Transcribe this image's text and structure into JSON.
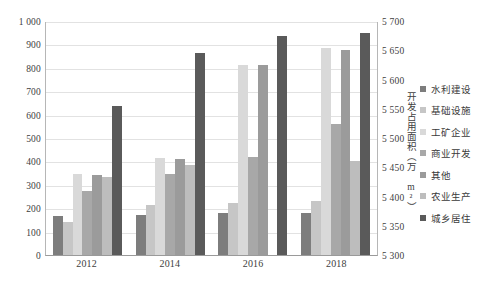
{
  "chart_data": {
    "type": "bar",
    "title": "",
    "subtitle": "",
    "xlabel": "",
    "ylabel": "",
    "categories": [
      "2012",
      "2014",
      "2016",
      "2018"
    ],
    "grid": true,
    "legend_position": "right",
    "axes": {
      "left": {
        "ylim": [
          0,
          1000
        ],
        "step": 100,
        "ticks": [
          "1 000",
          "900",
          "800",
          "700",
          "600",
          "500",
          "400",
          "300",
          "200",
          "100",
          "0"
        ],
        "tick_values": [
          1000,
          900,
          800,
          700,
          600,
          500,
          400,
          300,
          200,
          100,
          0
        ],
        "title": ""
      },
      "right": {
        "ylim": [
          5300,
          5700
        ],
        "step": 50,
        "ticks": [
          "5 700",
          "5 650",
          "5 600",
          "5 550",
          "5 500",
          "5 450",
          "5 400",
          "5 350",
          "5 300"
        ],
        "tick_values": [
          5700,
          5650,
          5600,
          5550,
          5500,
          5450,
          5400,
          5350,
          5300
        ],
        "title": "开发占用面积（万 m²）"
      }
    },
    "series": [
      {
        "name": "水利建设",
        "axis": "left",
        "color": "#7d7d7d",
        "values": [
          168,
          172,
          178,
          180
        ]
      },
      {
        "name": "基础设施",
        "axis": "left",
        "color": "#c6c6c6",
        "values": [
          142,
          215,
          222,
          232
        ]
      },
      {
        "name": "工矿企业",
        "axis": "left",
        "color": "#d9d9d9",
        "values": [
          345,
          413,
          812,
          885
        ]
      },
      {
        "name": "商业开发",
        "axis": "left",
        "color": "#a8a8a8",
        "values": [
          272,
          348,
          420,
          562
        ]
      },
      {
        "name": "其他",
        "axis": "left",
        "color": "#9b9b9b",
        "values": [
          340,
          412,
          810,
          875
        ]
      },
      {
        "name": "农业生产",
        "axis": "left",
        "color": "#bdbdbd",
        "values": [
          335,
          385,
          0,
          400
        ]
      },
      {
        "name": "城乡居住",
        "axis": "right",
        "color": "#5a5a5a",
        "values": [
          5555,
          5645,
          5675,
          5680
        ]
      }
    ]
  },
  "legend": {
    "items": [
      {
        "label": "水利建设",
        "color": "#7d7d7d"
      },
      {
        "label": "基础设施",
        "color": "#c6c6c6"
      },
      {
        "label": "工矿企业",
        "color": "#d9d9d9"
      },
      {
        "label": "商业开发",
        "color": "#a8a8a8"
      },
      {
        "label": "其他",
        "color": "#9b9b9b"
      },
      {
        "label": "农业生产",
        "color": "#bdbdbd"
      },
      {
        "label": "城乡居住",
        "color": "#5a5a5a"
      }
    ]
  },
  "colors": {
    "gridline": "#e2e2e2",
    "axis": "#b6b6b6",
    "text": "#3a3a3a",
    "background": "#ffffff"
  }
}
